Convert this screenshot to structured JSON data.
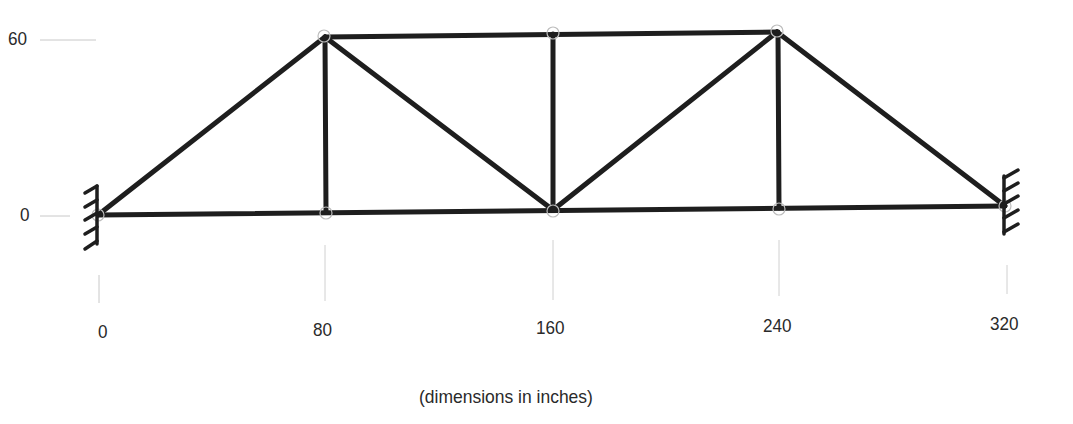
{
  "diagram": {
    "type": "truss",
    "caption": "(dimensions in inches)",
    "x_ticks": [
      {
        "label": "0",
        "value": 0
      },
      {
        "label": "80",
        "value": 80
      },
      {
        "label": "160",
        "value": 160
      },
      {
        "label": "240",
        "value": 240
      },
      {
        "label": "320",
        "value": 320
      }
    ],
    "y_ticks": [
      {
        "label": "60",
        "value": 60
      },
      {
        "label": "0",
        "value": 0
      }
    ],
    "nodes": [
      {
        "id": 1,
        "x": 0,
        "y": 0
      },
      {
        "id": 2,
        "x": 80,
        "y": 0
      },
      {
        "id": 3,
        "x": 160,
        "y": 0
      },
      {
        "id": 4,
        "x": 240,
        "y": 0
      },
      {
        "id": 5,
        "x": 320,
        "y": 0
      },
      {
        "id": 6,
        "x": 80,
        "y": 60
      },
      {
        "id": 7,
        "x": 160,
        "y": 60
      },
      {
        "id": 8,
        "x": 240,
        "y": 60
      }
    ],
    "members": [
      [
        1,
        2
      ],
      [
        2,
        3
      ],
      [
        3,
        4
      ],
      [
        4,
        5
      ],
      [
        6,
        7
      ],
      [
        7,
        8
      ],
      [
        1,
        6
      ],
      [
        6,
        2
      ],
      [
        6,
        3
      ],
      [
        7,
        3
      ],
      [
        3,
        8
      ],
      [
        8,
        4
      ],
      [
        8,
        5
      ]
    ],
    "supports": [
      {
        "node": 1,
        "type": "fixed-wall",
        "side": "left"
      },
      {
        "node": 5,
        "type": "fixed-wall",
        "side": "right"
      }
    ],
    "units": "inches"
  }
}
